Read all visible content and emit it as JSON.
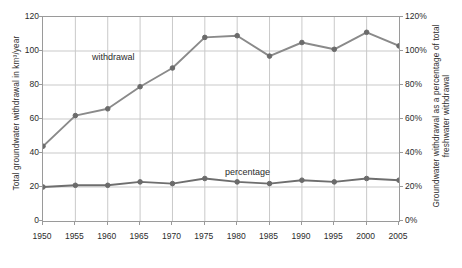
{
  "chart_data": {
    "type": "line",
    "title": "",
    "xlabel": "",
    "ylabel": "Total groundwater withdrawal in km³/year",
    "y2label": "Groundwater withdrawal as a percentage of total freshwater withdrawal",
    "x": [
      1950,
      1955,
      1960,
      1965,
      1970,
      1975,
      1980,
      1985,
      1990,
      1995,
      2000,
      2005
    ],
    "categories": [
      "1950",
      "1955",
      "1960",
      "1965",
      "1970",
      "1975",
      "1980",
      "1985",
      "1990",
      "1995",
      "2000",
      "2005"
    ],
    "xlim": [
      1950,
      2005
    ],
    "ylim": [
      0,
      120
    ],
    "y2lim": [
      0,
      120
    ],
    "yticks": [
      0,
      20,
      40,
      60,
      80,
      100,
      120
    ],
    "ytick_labels": [
      "0",
      "20",
      "40",
      "60",
      "80",
      "100",
      "120"
    ],
    "y2ticks": [
      0,
      20,
      40,
      60,
      80,
      100,
      120
    ],
    "y2tick_labels": [
      "0%",
      "20%",
      "40%",
      "60%",
      "80%",
      "100%",
      "120%"
    ],
    "grid": true,
    "legend_position": "inline-annotation",
    "series": [
      {
        "name": "withdrawal",
        "axis": "left",
        "unit": "km³/year",
        "color": "#8a8a8a",
        "values": [
          44,
          62,
          66,
          79,
          90,
          108,
          109,
          97,
          105,
          101,
          111,
          103
        ]
      },
      {
        "name": "percentage",
        "axis": "right",
        "unit": "%",
        "color": "#6e6e6e",
        "values": [
          20,
          21,
          21,
          23,
          22,
          25,
          23,
          22,
          24,
          23,
          25,
          24
        ]
      }
    ],
    "annotations": [
      {
        "text": "withdrawal",
        "x": 1962,
        "y": 104
      },
      {
        "text": "percentage",
        "x": 1988,
        "y": 33
      }
    ]
  },
  "colors": {
    "line": "#8a8a8a",
    "marker": "#6b6b6b",
    "grid": "#c9c9c9",
    "frame": "#9a9a9a",
    "text": "#2b2b2b",
    "background": "#ffffff"
  }
}
